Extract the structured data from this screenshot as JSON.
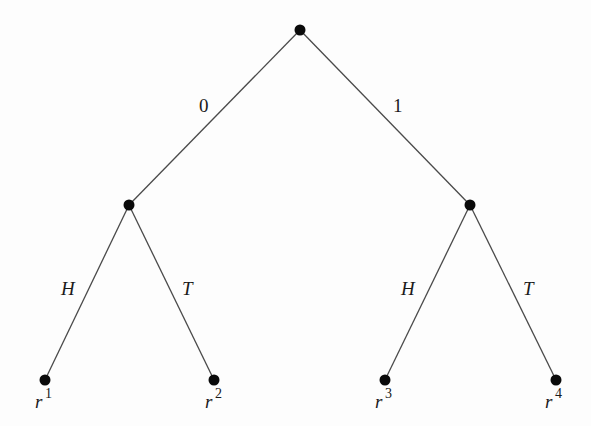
{
  "diagram": {
    "type": "tree",
    "nodes": {
      "root": {
        "x": 300,
        "y": 30
      },
      "left": {
        "x": 129,
        "y": 205
      },
      "right": {
        "x": 470,
        "y": 205
      },
      "leaf1": {
        "x": 45,
        "y": 380
      },
      "leaf2": {
        "x": 214,
        "y": 380
      },
      "leaf3": {
        "x": 385,
        "y": 380
      },
      "leaf4": {
        "x": 556,
        "y": 380
      }
    },
    "edges": [
      {
        "from": "root",
        "to": "left",
        "label": "0"
      },
      {
        "from": "root",
        "to": "right",
        "label": "1"
      },
      {
        "from": "left",
        "to": "leaf1",
        "label": "H"
      },
      {
        "from": "left",
        "to": "leaf2",
        "label": "T"
      },
      {
        "from": "right",
        "to": "leaf3",
        "label": "H"
      },
      {
        "from": "right",
        "to": "leaf4",
        "label": "T"
      }
    ],
    "edge_labels": {
      "root_left": "0",
      "root_right": "1",
      "left_leaf1": "H",
      "left_leaf2": "T",
      "right_leaf3": "H",
      "right_leaf4": "T"
    },
    "leaf_labels": {
      "leaf1": {
        "base": "r",
        "sup": "1"
      },
      "leaf2": {
        "base": "r",
        "sup": "2"
      },
      "leaf3": {
        "base": "r",
        "sup": "3"
      },
      "leaf4": {
        "base": "r",
        "sup": "4"
      }
    }
  }
}
